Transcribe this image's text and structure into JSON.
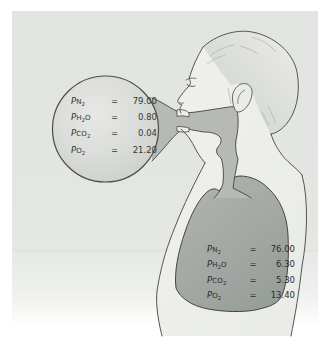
{
  "eq": "=",
  "inspired": {
    "rows": [
      {
        "p": "P",
        "main": "N",
        "sub": "2",
        "post": "",
        "value": "79.00"
      },
      {
        "p": "P",
        "main": "H",
        "sub": "2",
        "post": "O",
        "value": "0.80"
      },
      {
        "p": "P",
        "main": "CO",
        "sub": "2",
        "post": "",
        "value": "0.04"
      },
      {
        "p": "P",
        "main": "O",
        "sub": "2",
        "post": "",
        "value": "21.20"
      }
    ]
  },
  "alveolar": {
    "rows": [
      {
        "p": "P",
        "main": "N",
        "sub": "2",
        "post": "",
        "value": "76.00"
      },
      {
        "p": "P",
        "main": "H",
        "sub": "2",
        "post": "O",
        "value": "6.30"
      },
      {
        "p": "P",
        "main": "CO",
        "sub": "2",
        "post": "",
        "value": "5.30"
      },
      {
        "p": "P",
        "main": "O",
        "sub": "2",
        "post": "",
        "value": "13.40"
      }
    ]
  },
  "colors": {
    "panel_bg": "#e3e5e2",
    "body_fill": "#edefec",
    "balloon_fill": "#d8dad7",
    "airway_fill": "#b6b9b5",
    "lung_fill": "#a3a8a4",
    "outline": "#4b4d46",
    "text": "#33342e"
  }
}
